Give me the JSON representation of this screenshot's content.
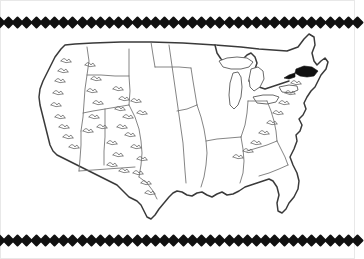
{
  "document": {
    "kind": "map-illustration",
    "title": "Outline map of the contiguous United States",
    "background_color": "#ffffff",
    "frame_color": "#e8e8e8"
  },
  "decoration": {
    "top_border": {
      "name": "diamond-border-top",
      "motif": "diamond",
      "count": 40,
      "color": "#111111",
      "size_px": 9
    },
    "bottom_border": {
      "name": "diamond-border-bottom",
      "motif": "diamond",
      "count": 40,
      "color": "#111111",
      "size_px": 9
    }
  },
  "map": {
    "region": "Contiguous United States",
    "style": "hand-drawn pen outline",
    "outline_color": "#3a3a3a",
    "interior_line_color": "#6f6f6f",
    "relief_symbol_color": "#6a6a6a",
    "highlight_color": "#111111",
    "features": {
      "coastline_label": "National outline",
      "state_lines_label": "State and river boundary lines",
      "great_lakes_label": "Great Lakes",
      "mountains_label": "Mountain range relief symbols",
      "highlight_label": "Shaded region in the Northeast"
    },
    "mountain_ranges": [
      "Cascade Range",
      "Sierra Nevada",
      "Rocky Mountains",
      "Great Basin ranges",
      "Appalachian Mountains"
    ],
    "great_lakes": [
      "Lake Superior",
      "Lake Michigan",
      "Lake Huron",
      "Lake Erie",
      "Lake Ontario"
    ]
  }
}
